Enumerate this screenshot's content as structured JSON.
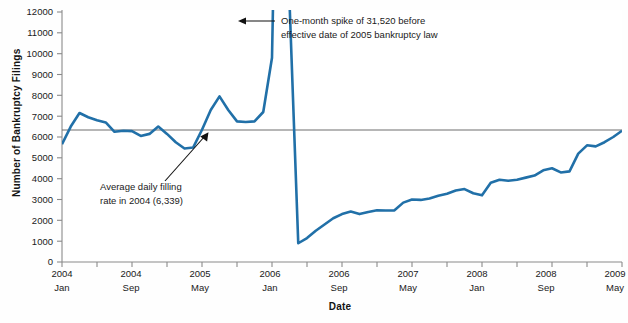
{
  "chart_data": {
    "type": "line",
    "title": "",
    "subtitle": "",
    "xlabel": "Date",
    "ylabel": "Number of Bankruptcy Filings",
    "ylim": [
      0,
      12000
    ],
    "ytick_labels": [
      "0",
      "1000",
      "2000",
      "3000",
      "4000",
      "5000",
      "6000",
      "7000",
      "8000",
      "9000",
      "10000",
      "11000",
      "12000"
    ],
    "ytick_values": [
      0,
      1000,
      2000,
      3000,
      4000,
      5000,
      6000,
      7000,
      8000,
      9000,
      10000,
      11000,
      12000
    ],
    "xtick_labels": [
      {
        "year": "2004",
        "month": "Jan"
      },
      {
        "year": "2004",
        "month": "Sep"
      },
      {
        "year": "2005",
        "month": "May"
      },
      {
        "year": "2006",
        "month": "Jan"
      },
      {
        "year": "2006",
        "month": "Sep"
      },
      {
        "year": "2007",
        "month": "May"
      },
      {
        "year": "2008",
        "month": "Jan"
      },
      {
        "year": "2008",
        "month": "Sep"
      },
      {
        "year": "2009",
        "month": "May"
      }
    ],
    "xtick_index": [
      0,
      8,
      16,
      24,
      32,
      40,
      48,
      56,
      64
    ],
    "grid": false,
    "legend": "none",
    "series": [
      {
        "name": "Monthly bankruptcy filings",
        "color": "#2170a8",
        "clipped_max": 12000,
        "values": [
          5650,
          6500,
          7150,
          6950,
          6800,
          6700,
          6250,
          6300,
          6280,
          6050,
          6150,
          6500,
          6150,
          5750,
          5450,
          5500,
          6350,
          7300,
          7950,
          7300,
          6750,
          6720,
          6750,
          7200,
          9800,
          31520,
          12500,
          900,
          1150,
          1500,
          1800,
          2100,
          2300,
          2420,
          2300,
          2400,
          2480,
          2470,
          2480,
          2850,
          3000,
          2980,
          3050,
          3180,
          3280,
          3430,
          3500,
          3300,
          3200,
          3800,
          3950,
          3900,
          3950,
          4050,
          4150,
          4400,
          4500,
          4300,
          4350,
          5200,
          5600,
          5550,
          5750,
          6000,
          6300
        ]
      }
    ],
    "reference_line": {
      "label": "Average daily filling rate in 2004",
      "value": 6339,
      "value_display": "6,339",
      "color": "#6e6e6e"
    },
    "annotations": [
      {
        "id": "spike-annotation",
        "line1": "One-month spike of 31,520 before",
        "line2": "effective date of 2005 bankruptcy law",
        "arrow": "left"
      },
      {
        "id": "average-annotation",
        "line1": "Average daily filling",
        "line2": "rate in 2004 (6,339)",
        "arrow": "up-right"
      }
    ]
  },
  "axis": {
    "y_title": "Number of Bankruptcy Filings",
    "x_title": "Date"
  },
  "colors": {
    "series": "#2170a8",
    "reference": "#6e6e6e",
    "axis": "#8a8a8a",
    "text": "#1a1a1a",
    "background": "#ffffff"
  }
}
